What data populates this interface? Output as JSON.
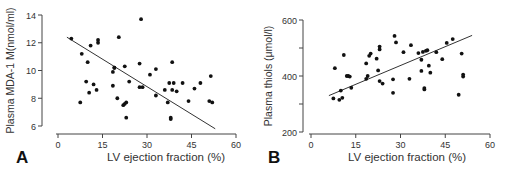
{
  "figure": {
    "panels": [
      {
        "label": "A",
        "xlabel": "LV ejection fraction (%)",
        "ylabel": "Plasma MDA-1 M(nmol/ml)"
      },
      {
        "label": "B",
        "xlabel": "LV ejection fraction (%)",
        "ylabel": "Plasma thiols (μmol/l)"
      }
    ]
  },
  "chart_data": [
    {
      "panel": "A",
      "type": "scatter",
      "title": "",
      "xlabel": "LV ejection fraction (%)",
      "ylabel": "Plasma MDA-1 M(nmol/ml)",
      "xlim": [
        0,
        60
      ],
      "ylim": [
        6,
        14
      ],
      "xticks": [
        0,
        15,
        30,
        45,
        60
      ],
      "yticks": [
        6,
        8,
        10,
        12,
        14
      ],
      "grid": false,
      "legend": null,
      "regression_line": {
        "x": [
          3,
          53
        ],
        "y": [
          12.4,
          5.8
        ]
      },
      "points": [
        [
          4.5,
          12.3
        ],
        [
          7.5,
          7.7
        ],
        [
          8,
          11.2
        ],
        [
          9.5,
          9.2
        ],
        [
          10,
          10.6
        ],
        [
          10.5,
          8.4
        ],
        [
          11,
          11.8
        ],
        [
          12,
          9.0
        ],
        [
          13,
          8.6
        ],
        [
          13.5,
          12.0
        ],
        [
          13.5,
          12.2
        ],
        [
          18.5,
          9.9
        ],
        [
          18.5,
          8.9
        ],
        [
          19,
          10.2
        ],
        [
          19,
          10.2
        ],
        [
          20,
          8.0
        ],
        [
          20.5,
          12.4
        ],
        [
          22,
          7.5
        ],
        [
          22.5,
          10.3
        ],
        [
          22.5,
          7.6
        ],
        [
          23,
          6.6
        ],
        [
          23,
          7.7
        ],
        [
          24,
          9.2
        ],
        [
          27.5,
          8.8
        ],
        [
          27.5,
          10.5
        ],
        [
          28,
          13.7
        ],
        [
          28.5,
          8.8
        ],
        [
          31,
          9.7
        ],
        [
          33,
          8.2
        ],
        [
          33,
          10.1
        ],
        [
          36,
          8.6
        ],
        [
          37,
          7.7
        ],
        [
          37.5,
          9.1
        ],
        [
          38,
          6.5
        ],
        [
          38,
          6.6
        ],
        [
          38.5,
          8.6
        ],
        [
          38.5,
          10.6
        ],
        [
          39,
          9.1
        ],
        [
          40,
          8.5
        ],
        [
          42,
          9.1
        ],
        [
          44,
          7.8
        ],
        [
          46,
          8.7
        ],
        [
          48,
          9.1
        ],
        [
          51,
          7.8
        ],
        [
          51.5,
          9.6
        ],
        [
          52,
          7.7
        ]
      ]
    },
    {
      "panel": "B",
      "type": "scatter",
      "title": "",
      "xlabel": "LV ejection fraction (%)",
      "ylabel": "Plasma thiols (μmol/l)",
      "xlim": [
        0,
        60
      ],
      "ylim": [
        200,
        600
      ],
      "xticks": [
        0,
        15,
        30,
        45,
        60
      ],
      "yticks": [
        200,
        400,
        600
      ],
      "grid": false,
      "legend": null,
      "regression_line": {
        "x": [
          6,
          54
        ],
        "y": [
          330,
          545
        ]
      },
      "points": [
        [
          7.5,
          320
        ],
        [
          8,
          428
        ],
        [
          9.5,
          315
        ],
        [
          10,
          348
        ],
        [
          10.5,
          322
        ],
        [
          11,
          475
        ],
        [
          12,
          400
        ],
        [
          12.5,
          400
        ],
        [
          13,
          398
        ],
        [
          13.5,
          358
        ],
        [
          18.5,
          445
        ],
        [
          18.5,
          390
        ],
        [
          19,
          400
        ],
        [
          19.5,
          472
        ],
        [
          20,
          480
        ],
        [
          22,
          462
        ],
        [
          22.5,
          420
        ],
        [
          23,
          382
        ],
        [
          23,
          495
        ],
        [
          23,
          505
        ],
        [
          24,
          373
        ],
        [
          27.5,
          340
        ],
        [
          27.5,
          388
        ],
        [
          28,
          543
        ],
        [
          28.5,
          520
        ],
        [
          31,
          485
        ],
        [
          33,
          390
        ],
        [
          33.5,
          510
        ],
        [
          36,
          482
        ],
        [
          37,
          458
        ],
        [
          37,
          418
        ],
        [
          37.5,
          486
        ],
        [
          38,
          357
        ],
        [
          38,
          352
        ],
        [
          38.5,
          490
        ],
        [
          39,
          492
        ],
        [
          39.5,
          437
        ],
        [
          40,
          412
        ],
        [
          42,
          485
        ],
        [
          44,
          460
        ],
        [
          45.5,
          518
        ],
        [
          47.5,
          532
        ],
        [
          49.5,
          333
        ],
        [
          50.5,
          480
        ],
        [
          51,
          405
        ],
        [
          51,
          398
        ]
      ]
    }
  ]
}
